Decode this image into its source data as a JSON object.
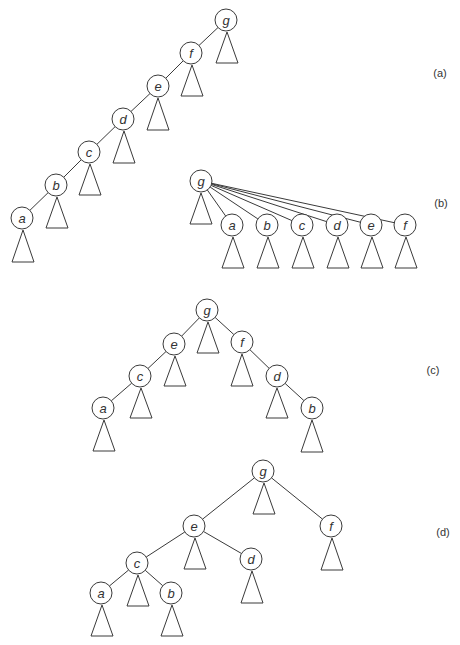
{
  "figure": {
    "node_radius": 11,
    "triangle_half_width": 11,
    "colors": {
      "stroke": "#3a3a3a",
      "text": "#333333",
      "background": "#ffffff"
    },
    "panels": [
      {
        "id": "a",
        "label": "(a)",
        "label_pos": [
          440,
          73
        ],
        "nodes": [
          {
            "id": "g",
            "label": "g",
            "x": 226,
            "y": 20
          },
          {
            "id": "f",
            "label": "f",
            "x": 191,
            "y": 53
          },
          {
            "id": "e",
            "label": "e",
            "x": 158,
            "y": 86
          },
          {
            "id": "d",
            "label": "d",
            "x": 123,
            "y": 119
          },
          {
            "id": "c",
            "label": "c",
            "x": 89,
            "y": 152
          },
          {
            "id": "b",
            "label": "b",
            "x": 56,
            "y": 185
          },
          {
            "id": "a",
            "label": "a",
            "x": 22,
            "y": 218
          }
        ],
        "edges": [
          [
            "g",
            "f"
          ],
          [
            "f",
            "e"
          ],
          [
            "e",
            "d"
          ],
          [
            "d",
            "c"
          ],
          [
            "c",
            "b"
          ],
          [
            "b",
            "a"
          ]
        ],
        "subtrees": [
          {
            "x": 227,
            "top": 32,
            "bottom": 63
          },
          {
            "x": 192,
            "top": 65,
            "bottom": 96
          },
          {
            "x": 158,
            "top": 98,
            "bottom": 130
          },
          {
            "x": 124,
            "top": 131,
            "bottom": 163
          },
          {
            "x": 90,
            "top": 164,
            "bottom": 195
          },
          {
            "x": 57,
            "top": 197,
            "bottom": 228
          },
          {
            "x": 23,
            "top": 230,
            "bottom": 262
          }
        ]
      },
      {
        "id": "b",
        "label": "(b)",
        "label_pos": [
          441,
          203
        ],
        "nodes": [
          {
            "id": "g",
            "label": "g",
            "x": 201,
            "y": 181
          },
          {
            "id": "a",
            "label": "a",
            "x": 232,
            "y": 225
          },
          {
            "id": "b",
            "label": "b",
            "x": 267,
            "y": 225
          },
          {
            "id": "c",
            "label": "c",
            "x": 302,
            "y": 225
          },
          {
            "id": "d",
            "label": "d",
            "x": 337,
            "y": 225
          },
          {
            "id": "e",
            "label": "e",
            "x": 371,
            "y": 225
          },
          {
            "id": "f",
            "label": "f",
            "x": 405,
            "y": 225
          }
        ],
        "edges": [
          [
            "g",
            "a"
          ],
          [
            "g",
            "b"
          ],
          [
            "g",
            "c"
          ],
          [
            "g",
            "d"
          ],
          [
            "g",
            "e"
          ],
          [
            "g",
            "f"
          ]
        ],
        "subtrees": [
          {
            "x": 201,
            "top": 193,
            "bottom": 224
          },
          {
            "x": 233,
            "top": 237,
            "bottom": 268
          },
          {
            "x": 268,
            "top": 237,
            "bottom": 268
          },
          {
            "x": 303,
            "top": 237,
            "bottom": 268
          },
          {
            "x": 338,
            "top": 237,
            "bottom": 268
          },
          {
            "x": 372,
            "top": 237,
            "bottom": 268
          },
          {
            "x": 406,
            "top": 237,
            "bottom": 268
          }
        ]
      },
      {
        "id": "c",
        "label": "(c)",
        "label_pos": [
          433,
          370
        ],
        "nodes": [
          {
            "id": "g",
            "label": "g",
            "x": 207,
            "y": 310
          },
          {
            "id": "e",
            "label": "e",
            "x": 174,
            "y": 344
          },
          {
            "id": "f",
            "label": "f",
            "x": 242,
            "y": 342
          },
          {
            "id": "c",
            "label": "c",
            "x": 140,
            "y": 376
          },
          {
            "id": "d",
            "label": "d",
            "x": 277,
            "y": 376
          },
          {
            "id": "a",
            "label": "a",
            "x": 103,
            "y": 408
          },
          {
            "id": "b",
            "label": "b",
            "x": 312,
            "y": 408
          }
        ],
        "edges": [
          [
            "g",
            "e"
          ],
          [
            "g",
            "f"
          ],
          [
            "e",
            "c"
          ],
          [
            "c",
            "a"
          ],
          [
            "f",
            "d"
          ],
          [
            "d",
            "b"
          ]
        ],
        "subtrees": [
          {
            "x": 208,
            "top": 322,
            "bottom": 353
          },
          {
            "x": 175,
            "top": 356,
            "bottom": 386
          },
          {
            "x": 242,
            "top": 354,
            "bottom": 386
          },
          {
            "x": 141,
            "top": 388,
            "bottom": 418
          },
          {
            "x": 277,
            "top": 388,
            "bottom": 418
          },
          {
            "x": 104,
            "top": 420,
            "bottom": 451
          },
          {
            "x": 312,
            "top": 420,
            "bottom": 452
          }
        ]
      },
      {
        "id": "d",
        "label": "(d)",
        "label_pos": [
          443,
          532
        ],
        "nodes": [
          {
            "id": "g",
            "label": "g",
            "x": 263,
            "y": 471
          },
          {
            "id": "e",
            "label": "e",
            "x": 194,
            "y": 526
          },
          {
            "id": "f",
            "label": "f",
            "x": 331,
            "y": 526
          },
          {
            "id": "c",
            "label": "c",
            "x": 137,
            "y": 563
          },
          {
            "id": "d",
            "label": "d",
            "x": 251,
            "y": 559
          },
          {
            "id": "a",
            "label": "a",
            "x": 101,
            "y": 593
          },
          {
            "id": "b",
            "label": "b",
            "x": 171,
            "y": 593
          }
        ],
        "edges": [
          [
            "g",
            "e"
          ],
          [
            "g",
            "f"
          ],
          [
            "e",
            "c"
          ],
          [
            "e",
            "d"
          ],
          [
            "c",
            "a"
          ],
          [
            "c",
            "b"
          ]
        ],
        "subtrees": [
          {
            "x": 264,
            "top": 483,
            "bottom": 514
          },
          {
            "x": 195,
            "top": 538,
            "bottom": 569
          },
          {
            "x": 332,
            "top": 538,
            "bottom": 570
          },
          {
            "x": 138,
            "top": 575,
            "bottom": 606
          },
          {
            "x": 252,
            "top": 571,
            "bottom": 603
          },
          {
            "x": 102,
            "top": 605,
            "bottom": 636
          },
          {
            "x": 172,
            "top": 605,
            "bottom": 636
          }
        ]
      }
    ]
  }
}
